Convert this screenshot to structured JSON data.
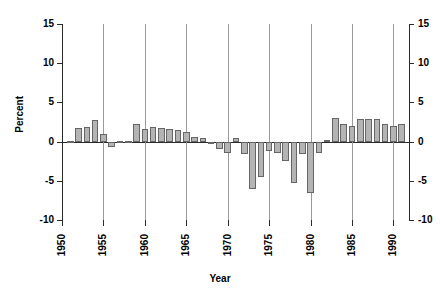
{
  "chart_data": {
    "type": "bar",
    "title": "",
    "xlabel": "Year",
    "ylabel": "Percent",
    "ylim": [
      -10,
      15
    ],
    "xlim": [
      1950,
      1992
    ],
    "yticks": [
      15,
      10,
      5,
      0,
      -5,
      -10
    ],
    "ytick_labels_left": [
      "15",
      "10",
      "5",
      "0",
      "-5",
      "-10"
    ],
    "ytick_labels_right": [
      "15",
      "10",
      "5",
      "0",
      "-5",
      "-10"
    ],
    "xticks": [
      1950,
      1955,
      1960,
      1965,
      1970,
      1975,
      1980,
      1985,
      1990
    ],
    "xtick_labels": [
      "1950",
      "1955",
      "1960",
      "1965",
      "1970",
      "1975",
      "1980",
      "1985",
      "1990"
    ],
    "grid": "vertical-only",
    "legend": "none",
    "bar_fill": "#b4b4b4",
    "bar_edge": "#666666",
    "axis_color": "#2b2b2b",
    "gridline_color": "#9a9a9a",
    "categories": [
      1951,
      1952,
      1953,
      1954,
      1955,
      1956,
      1957,
      1958,
      1959,
      1960,
      1961,
      1962,
      1963,
      1964,
      1965,
      1966,
      1967,
      1968,
      1969,
      1970,
      1971,
      1972,
      1973,
      1974,
      1975,
      1976,
      1977,
      1978,
      1979,
      1980,
      1981,
      1982,
      1983,
      1984,
      1985,
      1986,
      1987,
      1988,
      1989,
      1990,
      1991
    ],
    "values": [
      0.1,
      1.7,
      1.8,
      2.8,
      1.0,
      -0.7,
      0.05,
      0.1,
      2.2,
      1.6,
      1.9,
      1.7,
      1.6,
      1.5,
      1.2,
      0.6,
      0.5,
      -0.3,
      -0.9,
      -1.5,
      0.5,
      -1.6,
      -6.0,
      -4.5,
      -1.2,
      -1.5,
      -2.5,
      -5.3,
      -1.6,
      -6.5,
      -1.4,
      0.2,
      3.0,
      2.2,
      2.0,
      2.9,
      2.9,
      2.9,
      2.3,
      2.0,
      2.3
    ]
  }
}
